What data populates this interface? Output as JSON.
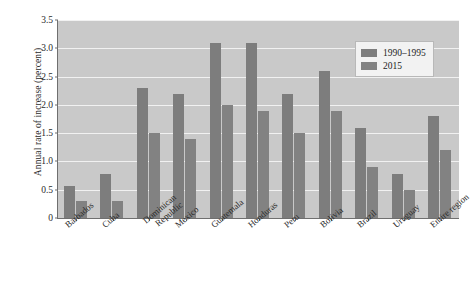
{
  "chart_data": {
    "type": "bar",
    "title": "",
    "subtitle": "",
    "xlabel": "",
    "ylabel": "Annual rate of increase (percent)",
    "ylim": [
      0,
      3.5
    ],
    "ytick_labels": [
      "0",
      "0.5",
      "1.0",
      "1.5",
      "2.0",
      "2.5",
      "3.0",
      "3.5"
    ],
    "ytick_values": [
      0,
      0.5,
      1.0,
      1.5,
      2.0,
      2.5,
      3.0,
      3.5
    ],
    "grid": "horizontal",
    "legend_position": "top-right",
    "categories": [
      "Barbados",
      "Cuba",
      "Dominican Republic",
      "Mexico",
      "Guatemala",
      "Honduras",
      "Peru",
      "Bolivia",
      "Brazil",
      "Uruguay",
      "Entire region"
    ],
    "series": [
      {
        "name": "1990–1995",
        "color": "#7d7d7d",
        "values": [
          0.57,
          0.78,
          2.3,
          2.2,
          3.1,
          3.1,
          2.2,
          2.6,
          1.6,
          0.78,
          1.8
        ]
      },
      {
        "name": "2015",
        "color": "#828282",
        "values": [
          0.3,
          0.3,
          1.5,
          1.4,
          2.0,
          1.9,
          1.5,
          1.9,
          0.9,
          0.5,
          1.2
        ]
      }
    ]
  },
  "legend": {
    "items": [
      {
        "label": "1990–1995"
      },
      {
        "label": "2015"
      }
    ]
  }
}
